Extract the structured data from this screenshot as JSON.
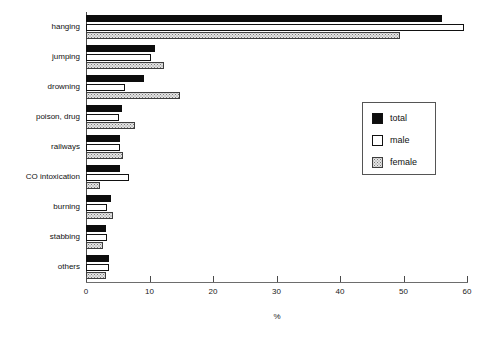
{
  "chart_data": {
    "type": "bar",
    "orientation": "horizontal",
    "title": "",
    "xlabel": "%",
    "ylabel": "",
    "xlim": [
      0,
      60
    ],
    "xticks": [
      0,
      10,
      20,
      30,
      40,
      50,
      60
    ],
    "xtick_labels": [
      "0",
      "10",
      "20",
      "30",
      "40",
      "50",
      "60"
    ],
    "grid": false,
    "legend_position": "right",
    "categories": [
      "hanging",
      "jumping",
      "drowning",
      "poison, drug",
      "railways",
      "CO intoxication",
      "burning",
      "stabbing",
      "others"
    ],
    "series": [
      {
        "name": "total",
        "fill": "black",
        "values": [
          56.0,
          10.9,
          9.1,
          5.7,
          5.4,
          5.3,
          3.9,
          3.1,
          3.6
        ]
      },
      {
        "name": "male",
        "fill": "white",
        "values": [
          59.5,
          10.2,
          6.1,
          5.2,
          5.4,
          6.8,
          3.3,
          3.3,
          3.6
        ]
      },
      {
        "name": "female",
        "fill": "dotted-gray",
        "values": [
          49.5,
          12.3,
          14.8,
          7.7,
          5.9,
          2.2,
          4.3,
          2.6,
          3.2
        ]
      }
    ]
  },
  "legend": {
    "items": [
      {
        "label": "total"
      },
      {
        "label": "male"
      },
      {
        "label": "female"
      }
    ]
  },
  "colors": {
    "total": "#0d0d0d",
    "male": "#ffffff",
    "female": "#e4e4e4",
    "axis": "#4a4a4a",
    "text": "#111111"
  }
}
